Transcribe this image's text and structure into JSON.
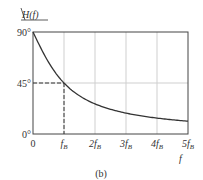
{
  "chart_data": {
    "type": "line",
    "title": "",
    "ylabel": "/H(f)",
    "xlabel": "f",
    "caption": "(b)",
    "x_ticks": [
      {
        "value": 0,
        "label": "0",
        "sub": ""
      },
      {
        "value": 1,
        "label": "f",
        "sub": "B"
      },
      {
        "value": 2,
        "label": "2f",
        "sub": "B"
      },
      {
        "value": 3,
        "label": "3f",
        "sub": "B"
      },
      {
        "value": 4,
        "label": "4f",
        "sub": "B"
      },
      {
        "value": 5,
        "label": "5f",
        "sub": "B"
      }
    ],
    "y_ticks": [
      {
        "value": 0,
        "label": "0°"
      },
      {
        "value": 45,
        "label": "45°"
      },
      {
        "value": 90,
        "label": "90°"
      }
    ],
    "xlim": [
      0,
      5
    ],
    "ylim": [
      0,
      90
    ],
    "grid": true,
    "series": [
      {
        "name": "phase of H(f)",
        "x": [
          0,
          0.25,
          0.5,
          0.75,
          1,
          1.5,
          2,
          2.5,
          3,
          3.5,
          4,
          4.5,
          5
        ],
        "y": [
          90,
          76.0,
          63.4,
          53.1,
          45,
          33.7,
          26.6,
          21.8,
          18.4,
          15.9,
          14.0,
          12.5,
          11.3
        ]
      }
    ],
    "annotations": [
      {
        "type": "dashed-guide",
        "x": 1,
        "y": 45
      }
    ]
  }
}
